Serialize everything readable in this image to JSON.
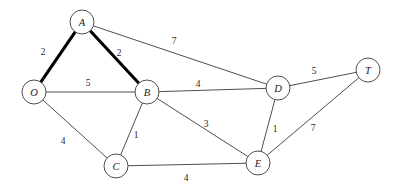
{
  "figure": {
    "background_color": "#ffffff",
    "edge_color": "#3a3a3a",
    "bold_edge_color": "#000000",
    "node_fill": "#ffffff",
    "label_color": "#1a1a1a"
  },
  "graph_data": {
    "type": "node-link-diagram",
    "directed": false,
    "weighted": true,
    "node_radius": 12,
    "nodes": [
      {
        "id": "O",
        "label": "O",
        "x": 34,
        "y": 92
      },
      {
        "id": "A",
        "label": "A",
        "x": 82,
        "y": 22
      },
      {
        "id": "B",
        "label": "B",
        "x": 147,
        "y": 92
      },
      {
        "id": "C",
        "label": "C",
        "x": 116,
        "y": 166
      },
      {
        "id": "D",
        "label": "D",
        "x": 278,
        "y": 88
      },
      {
        "id": "E",
        "label": "E",
        "x": 258,
        "y": 163
      },
      {
        "id": "T",
        "label": "T",
        "x": 368,
        "y": 70
      }
    ],
    "edges": [
      {
        "source": "O",
        "target": "A",
        "weight": "2",
        "bold": true,
        "lx": 43,
        "ly": 52
      },
      {
        "source": "A",
        "target": "B",
        "weight": "2",
        "bold": true,
        "lx": 119,
        "ly": 53
      },
      {
        "source": "A",
        "target": "D",
        "weight": "7",
        "bold": false,
        "lx": 174,
        "ly": 41
      },
      {
        "source": "O",
        "target": "B",
        "weight": "5",
        "bold": false,
        "lx": 88,
        "ly": 83
      },
      {
        "source": "O",
        "target": "C",
        "weight": "4",
        "bold": false,
        "lx": 63,
        "ly": 141
      },
      {
        "source": "B",
        "target": "C",
        "weight": "1",
        "bold": false,
        "lx": 136,
        "ly": 135
      },
      {
        "source": "B",
        "target": "D",
        "weight": "4",
        "bold": false,
        "lx": 198,
        "ly": 84
      },
      {
        "source": "B",
        "target": "E",
        "weight": "3",
        "bold": false,
        "lx": 206,
        "ly": 124
      },
      {
        "source": "C",
        "target": "E",
        "weight": "4",
        "bold": false,
        "lx": 186,
        "ly": 178
      },
      {
        "source": "D",
        "target": "E",
        "weight": "1",
        "bold": false,
        "lx": 275,
        "ly": 129
      },
      {
        "source": "D",
        "target": "T",
        "weight": "5",
        "bold": false,
        "lx": 314,
        "ly": 71
      },
      {
        "source": "E",
        "target": "T",
        "weight": "7",
        "bold": false,
        "lx": 313,
        "ly": 128
      }
    ],
    "highlighted_path": [
      "O",
      "A",
      "B"
    ]
  }
}
